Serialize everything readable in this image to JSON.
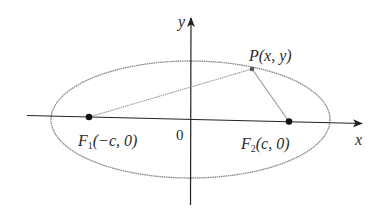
{
  "diagram": {
    "axes": {
      "x_label": "x",
      "y_label": "y",
      "origin_label": "0"
    },
    "point_p": {
      "name": "P",
      "coords": "(x, y)"
    },
    "focus_1": {
      "name": "F",
      "subscript": "1",
      "coords": "(−c, 0)"
    },
    "focus_2": {
      "name": "F",
      "subscript": "2",
      "coords": "(c, 0)"
    },
    "colors": {
      "axis": "#222222",
      "ellipse": "#8a8a8a",
      "segment": "#9a9a9a",
      "point": "#111111",
      "text": "#2b2b2b"
    }
  }
}
